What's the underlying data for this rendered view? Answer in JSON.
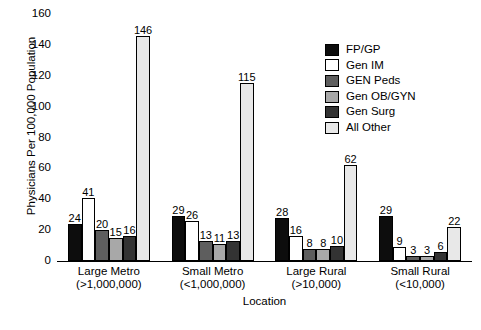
{
  "chart_data": {
    "type": "bar",
    "title": "",
    "xlabel": "Location",
    "ylabel": "Physicians Per 100,000 Population",
    "ylim": [
      0,
      160
    ],
    "yticks": [
      160,
      140,
      120,
      100,
      80,
      60,
      40,
      20,
      0
    ],
    "grid": false,
    "legend_position": "upper right",
    "categories": [
      "Large Metro\n(>1,000,000)",
      "Small Metro\n(<1,000,000)",
      "Large Rural\n(>10,000)",
      "Small Rural\n(<10,000)"
    ],
    "category_lines": [
      {
        "name": "Large Metro",
        "sub": "(>1,000,000)"
      },
      {
        "name": "Small Metro",
        "sub": "(<1,000,000)"
      },
      {
        "name": "Large Rural",
        "sub": "(>10,000)"
      },
      {
        "name": "Small Rural",
        "sub": "(<10,000)"
      }
    ],
    "series": [
      {
        "name": "FP/GP",
        "color": "#0d0d0d",
        "values": [
          24,
          29,
          28,
          29
        ]
      },
      {
        "name": "Gen IM",
        "color": "#ffffff",
        "values": [
          41,
          26,
          16,
          9
        ]
      },
      {
        "name": "GEN Peds",
        "color": "#5e5e5e",
        "values": [
          20,
          13,
          8,
          3
        ]
      },
      {
        "name": "Gen OB/GYN",
        "color": "#a8a8a8",
        "values": [
          15,
          11,
          8,
          3
        ]
      },
      {
        "name": "Gen Surg",
        "color": "#333333",
        "values": [
          16,
          13,
          10,
          6
        ]
      },
      {
        "name": "All Other",
        "color": "#e8e8e8",
        "values": [
          146,
          115,
          62,
          22
        ]
      }
    ]
  },
  "caption": {
    "text": ""
  }
}
